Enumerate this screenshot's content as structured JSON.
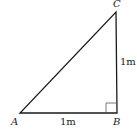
{
  "diagram": {
    "type": "right-triangle",
    "vertices": {
      "A": {
        "label": "A"
      },
      "B": {
        "label": "B"
      },
      "C": {
        "label": "C"
      }
    },
    "sides": {
      "AB": {
        "label": "1m"
      },
      "BC": {
        "label": "1m"
      }
    },
    "right_angle_at": "B"
  }
}
